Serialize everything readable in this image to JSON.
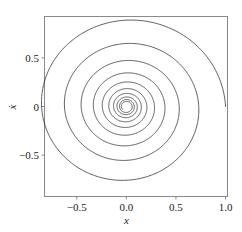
{
  "chart_data": {
    "type": "line",
    "title": "",
    "subtitle": "",
    "xlabel": "x",
    "ylabel": "ẋ",
    "xlim": [
      -0.82,
      1.02
    ],
    "ylim": [
      -0.92,
      0.92
    ],
    "grid": false,
    "legend": null,
    "annotations": [],
    "xticks": [
      -0.5,
      0.0,
      0.5,
      1.0
    ],
    "xtick_labels": [
      "−0.5",
      "0.0",
      "0.5",
      "1.0"
    ],
    "yticks": [
      0.5,
      0.0,
      -0.5
    ],
    "ytick_labels": [
      "0.5",
      "0",
      "−0.5"
    ],
    "series": [
      {
        "name": "trajectory",
        "color": "#1a1a1a",
        "linewidth": 0.7,
        "description": "damped-oscillator phase trajectory spiralling inward from (1.0, 0) to the origin",
        "start_point": [
          1.0,
          0.0
        ],
        "end_point": [
          0.0,
          0.0
        ],
        "spiral": {
          "center": [
            0.0,
            0.0
          ],
          "r0": 1.0,
          "decay_per_turn": 0.73,
          "turns": 9.6,
          "start_angle_deg": 0,
          "direction": "clockwise",
          "y_scale": 0.96
        },
        "axis_crossings_positive_x": [
          1.0,
          0.84,
          0.655,
          0.48,
          0.355,
          0.26,
          0.185,
          0.135,
          0.095,
          0.07
        ],
        "axis_crossings_negative_x": [
          -0.74,
          -0.585,
          -0.455,
          -0.335,
          -0.25,
          -0.175,
          -0.13,
          -0.09,
          -0.065
        ],
        "axis_crossings_positive_y": [
          0.84,
          0.555,
          0.425,
          0.295,
          0.215,
          0.15,
          0.105,
          0.075
        ],
        "axis_crossings_negative_y": [
          -0.88,
          -0.675,
          -0.51,
          -0.375,
          -0.27,
          -0.19,
          -0.135,
          -0.095
        ]
      }
    ]
  },
  "style": {
    "frame_color": "#8a8a8a",
    "tick_color": "#8a8a8a",
    "line_color": "#1a1a1a",
    "text_color": "#1a1a1a",
    "background": "#ffffff"
  }
}
